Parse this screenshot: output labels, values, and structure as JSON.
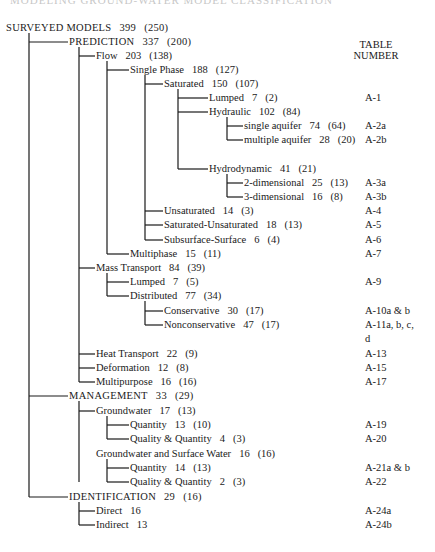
{
  "page_title_partial": "MODELING GROUND-WATER MODEL CLASSIFICATION",
  "table_header": {
    "line1": "TABLE",
    "line2": "NUMBER"
  },
  "nodes": [
    {
      "id": "surveyed",
      "label": "SURVEYED MODELS",
      "count": "399",
      "sub": "(250)",
      "x": 6,
      "y": 28,
      "table": ""
    },
    {
      "id": "prediction",
      "label": "PREDICTION",
      "count": "337",
      "sub": "(200)",
      "x": 69,
      "y": 42,
      "table": ""
    },
    {
      "id": "flow",
      "label": "Flow",
      "count": "203",
      "sub": "(138)",
      "x": 96,
      "y": 56,
      "table": ""
    },
    {
      "id": "single-phase",
      "label": "Single Phase",
      "count": "188",
      "sub": "(127)",
      "x": 130,
      "y": 70,
      "table": ""
    },
    {
      "id": "saturated",
      "label": "Saturated",
      "count": "150",
      "sub": "(107)",
      "x": 164,
      "y": 84,
      "table": ""
    },
    {
      "id": "lumped-flow",
      "label": "Lumped",
      "count": "7",
      "sub": "(2)",
      "x": 209,
      "y": 98,
      "table": "A-1"
    },
    {
      "id": "hydraulic",
      "label": "Hydraulic",
      "count": "102",
      "sub": "(84)",
      "x": 209,
      "y": 112,
      "table": ""
    },
    {
      "id": "single-aquifer",
      "label": "single aquifer",
      "count": "74",
      "sub": "(64)",
      "x": 244,
      "y": 126,
      "table": "A-2a"
    },
    {
      "id": "multiple-aquifer",
      "label": "multiple aquifer",
      "count": "28",
      "sub": "(20)",
      "x": 244,
      "y": 140,
      "table": "A-2b"
    },
    {
      "id": "hydrodynamic",
      "label": "Hydrodynamic",
      "count": "41",
      "sub": "(21)",
      "x": 209,
      "y": 169,
      "table": ""
    },
    {
      "id": "two-dim",
      "label": "2-dimensional",
      "count": "25",
      "sub": "(13)",
      "x": 244,
      "y": 183,
      "table": "A-3a"
    },
    {
      "id": "three-dim",
      "label": "3-dimensional",
      "count": "16",
      "sub": "(8)",
      "x": 244,
      "y": 197,
      "table": "A-3b"
    },
    {
      "id": "unsaturated",
      "label": "Unsaturated",
      "count": "14",
      "sub": "(3)",
      "x": 164,
      "y": 211,
      "table": "A-4"
    },
    {
      "id": "sat-unsat",
      "label": "Saturated-Unsaturated",
      "count": "18",
      "sub": "(13)",
      "x": 164,
      "y": 225,
      "table": "A-5"
    },
    {
      "id": "subsurface-surface",
      "label": "Subsurface-Surface",
      "count": "6",
      "sub": "(4)",
      "x": 164,
      "y": 240,
      "table": "A-6"
    },
    {
      "id": "multiphase",
      "label": "Multiphase",
      "count": "15",
      "sub": "(11)",
      "x": 130,
      "y": 254,
      "table": "A-7"
    },
    {
      "id": "mass-transport",
      "label": "Mass Transport",
      "count": "84",
      "sub": "(39)",
      "x": 96,
      "y": 268,
      "table": ""
    },
    {
      "id": "lumped-mass",
      "label": "Lumped",
      "count": "7",
      "sub": "(5)",
      "x": 130,
      "y": 282,
      "table": "A-9"
    },
    {
      "id": "distributed",
      "label": "Distributed",
      "count": "77",
      "sub": "(34)",
      "x": 130,
      "y": 296,
      "table": ""
    },
    {
      "id": "conservative",
      "label": "Conservative",
      "count": "30",
      "sub": "(17)",
      "x": 164,
      "y": 311,
      "table": "A-10a & b"
    },
    {
      "id": "nonconservative",
      "label": "Nonconservative",
      "count": "47",
      "sub": "(17)",
      "x": 164,
      "y": 325,
      "table": "A-11a, b, c,"
    },
    {
      "id": "nonconservative-cont",
      "label": "",
      "count": "",
      "sub": "",
      "x": 164,
      "y": 339,
      "table": "d"
    },
    {
      "id": "heat-transport",
      "label": "Heat Transport",
      "count": "22",
      "sub": "(9)",
      "x": 96,
      "y": 354,
      "table": "A-13"
    },
    {
      "id": "deformation",
      "label": "Deformation",
      "count": "12",
      "sub": "(8)",
      "x": 96,
      "y": 368,
      "table": "A-15"
    },
    {
      "id": "multipurpose",
      "label": "Multipurpose",
      "count": "16",
      "sub": "(16)",
      "x": 96,
      "y": 382,
      "table": "A-17"
    },
    {
      "id": "management",
      "label": "MANAGEMENT",
      "count": "33",
      "sub": "(29)",
      "x": 69,
      "y": 396,
      "table": ""
    },
    {
      "id": "groundwater",
      "label": "Groundwater",
      "count": "17",
      "sub": "(13)",
      "x": 96,
      "y": 411,
      "table": ""
    },
    {
      "id": "gw-quantity",
      "label": "Quantity",
      "count": "13",
      "sub": "(10)",
      "x": 130,
      "y": 425,
      "table": "A-19"
    },
    {
      "id": "gw-quality-quantity",
      "label": "Quality & Quantity",
      "count": "4",
      "sub": "(3)",
      "x": 130,
      "y": 439,
      "table": "A-20"
    },
    {
      "id": "gw-surface-water",
      "label": "Groundwater and Surface Water",
      "count": "16",
      "sub": "(16)",
      "x": 96,
      "y": 454,
      "table": ""
    },
    {
      "id": "gwsw-quantity",
      "label": "Quantity",
      "count": "14",
      "sub": "(13)",
      "x": 130,
      "y": 468,
      "table": "A-21a & b"
    },
    {
      "id": "gwsw-quality-quantity",
      "label": "Quality & Quantity",
      "count": "2",
      "sub": "(3)",
      "x": 130,
      "y": 482,
      "table": "A-22"
    },
    {
      "id": "identification",
      "label": "IDENTIFICATION",
      "count": "29",
      "sub": "(16)",
      "x": 69,
      "y": 497,
      "table": ""
    },
    {
      "id": "direct",
      "label": "Direct",
      "count": "16",
      "sub": "",
      "x": 96,
      "y": 511,
      "table": "A-24a"
    },
    {
      "id": "indirect",
      "label": "Indirect",
      "count": "13",
      "sub": "",
      "x": 96,
      "y": 525,
      "table": "A-24b"
    }
  ],
  "connectors": {
    "verticals": [
      {
        "x": 29,
        "y1": 33,
        "y2": 497
      },
      {
        "x": 79,
        "y1": 47,
        "y2": 382
      },
      {
        "x": 107,
        "y1": 61,
        "y2": 254
      },
      {
        "x": 145,
        "y1": 75,
        "y2": 240
      },
      {
        "x": 178,
        "y1": 89,
        "y2": 169
      },
      {
        "x": 227,
        "y1": 117,
        "y2": 140
      },
      {
        "x": 227,
        "y1": 174,
        "y2": 197
      },
      {
        "x": 107,
        "y1": 273,
        "y2": 296
      },
      {
        "x": 145,
        "y1": 301,
        "y2": 325
      },
      {
        "x": 79,
        "y1": 401,
        "y2": 482
      },
      {
        "x": 107,
        "y1": 416,
        "y2": 439
      },
      {
        "x": 107,
        "y1": 459,
        "y2": 482
      },
      {
        "x": 79,
        "y1": 502,
        "y2": 525
      }
    ],
    "horizontals": [
      {
        "x1": 29,
        "x2": 68,
        "y": 42
      },
      {
        "x1": 79,
        "x2": 95,
        "y": 56
      },
      {
        "x1": 107,
        "x2": 129,
        "y": 70
      },
      {
        "x1": 145,
        "x2": 163,
        "y": 84
      },
      {
        "x1": 178,
        "x2": 208,
        "y": 98
      },
      {
        "x1": 178,
        "x2": 208,
        "y": 112
      },
      {
        "x1": 227,
        "x2": 243,
        "y": 126
      },
      {
        "x1": 227,
        "x2": 243,
        "y": 140
      },
      {
        "x1": 178,
        "x2": 208,
        "y": 169
      },
      {
        "x1": 227,
        "x2": 243,
        "y": 183
      },
      {
        "x1": 227,
        "x2": 243,
        "y": 197
      },
      {
        "x1": 145,
        "x2": 163,
        "y": 211
      },
      {
        "x1": 145,
        "x2": 163,
        "y": 225
      },
      {
        "x1": 145,
        "x2": 163,
        "y": 240
      },
      {
        "x1": 107,
        "x2": 129,
        "y": 254
      },
      {
        "x1": 79,
        "x2": 95,
        "y": 268
      },
      {
        "x1": 107,
        "x2": 129,
        "y": 282
      },
      {
        "x1": 107,
        "x2": 129,
        "y": 296
      },
      {
        "x1": 145,
        "x2": 163,
        "y": 311
      },
      {
        "x1": 145,
        "x2": 163,
        "y": 325
      },
      {
        "x1": 79,
        "x2": 95,
        "y": 354
      },
      {
        "x1": 79,
        "x2": 95,
        "y": 368
      },
      {
        "x1": 79,
        "x2": 95,
        "y": 382
      },
      {
        "x1": 29,
        "x2": 68,
        "y": 396
      },
      {
        "x1": 79,
        "x2": 95,
        "y": 411
      },
      {
        "x1": 107,
        "x2": 129,
        "y": 425
      },
      {
        "x1": 107,
        "x2": 129,
        "y": 439
      },
      {
        "x1": 107,
        "x2": 129,
        "y": 468
      },
      {
        "x1": 107,
        "x2": 129,
        "y": 482
      },
      {
        "x1": 29,
        "x2": 68,
        "y": 497
      },
      {
        "x1": 79,
        "x2": 95,
        "y": 511
      },
      {
        "x1": 79,
        "x2": 95,
        "y": 525
      }
    ]
  }
}
